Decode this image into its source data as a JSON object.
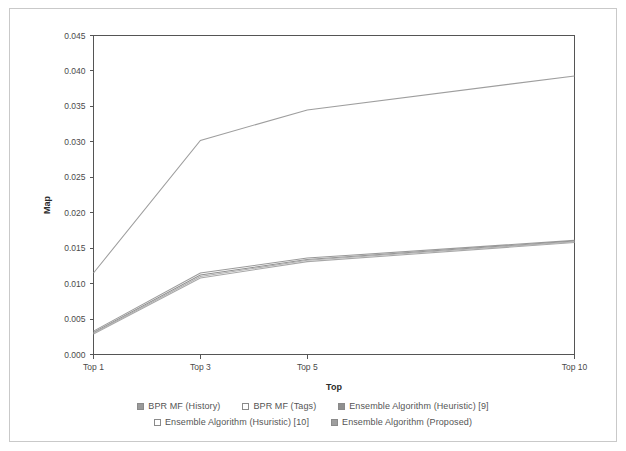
{
  "chart_data": {
    "type": "line",
    "title": "",
    "xlabel": "Top",
    "ylabel": "Map",
    "categories": [
      "Top 1",
      "Top 3",
      "Top 5",
      "Top 10"
    ],
    "x_positions": [
      1,
      3,
      5,
      10
    ],
    "xlim": [
      1,
      10
    ],
    "ylim": [
      0.0,
      0.045
    ],
    "y_ticks": [
      "0.000",
      "0.005",
      "0.010",
      "0.015",
      "0.020",
      "0.025",
      "0.030",
      "0.035",
      "0.040",
      "0.045"
    ],
    "y_tick_values": [
      0.0,
      0.005,
      0.01,
      0.015,
      0.02,
      0.025,
      0.03,
      0.035,
      0.04,
      0.045
    ],
    "grid": false,
    "legend_position": "bottom",
    "series": [
      {
        "name": "BPR MF (History)",
        "color": "#9a9a9a",
        "swatch_fill": "#9a9a9a",
        "values": [
          0.0033,
          0.0115,
          0.0136,
          0.0161
        ]
      },
      {
        "name": "BPR MF (Tags)",
        "color": "#a8a8a8",
        "swatch_fill": "#ffffff",
        "values": [
          0.0029,
          0.0108,
          0.0131,
          0.0158
        ]
      },
      {
        "name": "Ensemble Algorithm (Heuristic) [9]",
        "color": "#8f8f8f",
        "swatch_fill": "#8f8f8f",
        "values": [
          0.0031,
          0.0112,
          0.0134,
          0.016
        ]
      },
      {
        "name": "Ensemble Algorithm (Hsuristic) [10]",
        "color": "#b0b0b0",
        "swatch_fill": "#ffffff",
        "values": [
          0.003,
          0.011,
          0.0133,
          0.0159
        ]
      },
      {
        "name": "Ensemble Algorithm (Proposed)",
        "color": "#9e9e9e",
        "swatch_fill": "#9e9e9e",
        "values": [
          0.0115,
          0.0302,
          0.0345,
          0.0393
        ]
      }
    ]
  },
  "axes": {
    "y_title": "Map",
    "x_title": "Top"
  },
  "legend": {
    "rows": [
      [
        {
          "label": "BPR MF (History)"
        },
        {
          "label": "BPR MF (Tags)"
        },
        {
          "label": "Ensemble Algorithm (Heuristic) [9]"
        }
      ],
      [
        {
          "label": "Ensemble Algorithm (Hsuristic) [10]"
        },
        {
          "label": "Ensemble Algorithm (Proposed)"
        }
      ]
    ]
  },
  "colors": {
    "frame": "#555555",
    "text": "#4a4a4a",
    "outer_border": "#c9c9c9"
  }
}
